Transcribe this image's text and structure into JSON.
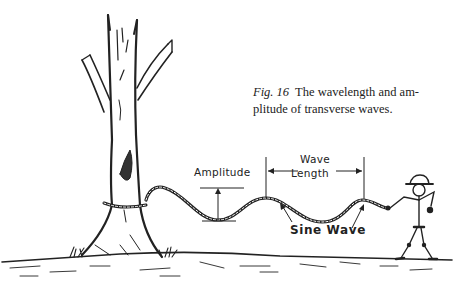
{
  "figure": {
    "caption": {
      "number": "Fig. 16",
      "line1": "The wavelength and am-",
      "line2": "plitude of transverse waves."
    },
    "labels": {
      "amplitude": "Amplitude",
      "wave_length_1": "Wave",
      "wave_length_2": "Length",
      "sine_wave": "Sine Wave"
    },
    "elements": [
      "tree",
      "rope",
      "stick-figure-person",
      "ground"
    ],
    "colors": {
      "ink": "#222222",
      "background": "#ffffff"
    }
  }
}
